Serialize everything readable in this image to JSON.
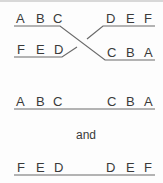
{
  "diagram": {
    "crossing": {
      "top_left_letters": [
        "A",
        "B",
        "C"
      ],
      "top_right_letters": [
        "D",
        "E",
        "F"
      ],
      "bottom_left_letters": [
        "F",
        "E",
        "D"
      ],
      "bottom_right_letters": [
        "C",
        "B",
        "A"
      ]
    },
    "result_1": {
      "left_letters": [
        "A",
        "B",
        "C"
      ],
      "right_letters": [
        "C",
        "B",
        "A"
      ]
    },
    "connector": "and",
    "result_2": {
      "left_letters": [
        "F",
        "E",
        "D"
      ],
      "right_letters": [
        "D",
        "E",
        "F"
      ]
    },
    "colors": {
      "line": "#6a6a6a",
      "text": "#3a3a3a"
    }
  }
}
